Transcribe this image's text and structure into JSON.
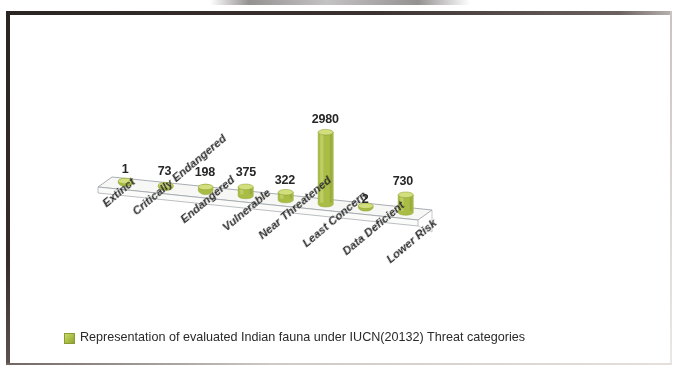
{
  "chart_data": {
    "type": "bar",
    "render_style": "3d-cylinder",
    "title": "",
    "xlabel": "",
    "ylabel": "",
    "grid": false,
    "legend_position": "bottom",
    "categories": [
      "Extinct",
      "Critically Endangered",
      "Endangered",
      "Vulnerable",
      "Near Threatened",
      "Least Concern",
      "Data Deficient",
      "Lower Risk"
    ],
    "values": [
      1,
      73,
      198,
      375,
      322,
      2980,
      2,
      730
    ],
    "value_labels": [
      "1",
      "73",
      "198",
      "375",
      "322",
      "2980",
      "2",
      "730"
    ],
    "series": [
      {
        "name": "Representation of evaluated Indian fauna under IUCN(20132) Threat categories",
        "values": [
          1,
          73,
          198,
          375,
          322,
          2980,
          2,
          730
        ],
        "color": "#a9bc45"
      }
    ],
    "ylim": [
      0,
      2980
    ],
    "legend": [
      "Representation of evaluated Indian fauna under IUCN(20132) Threat categories"
    ]
  },
  "legend": {
    "swatch_color": "#a9bc45",
    "text": "Representation of evaluated Indian fauna under IUCN(20132) Threat categories"
  },
  "colors": {
    "bar_fill": "#a9bc45",
    "bar_highlight": "#d3de7c",
    "bar_shadow": "#8a9c33",
    "floor": "#f7f7f5",
    "floor_edge": "#9aa0a6",
    "text": "#262626",
    "frame": "#2a2422"
  }
}
